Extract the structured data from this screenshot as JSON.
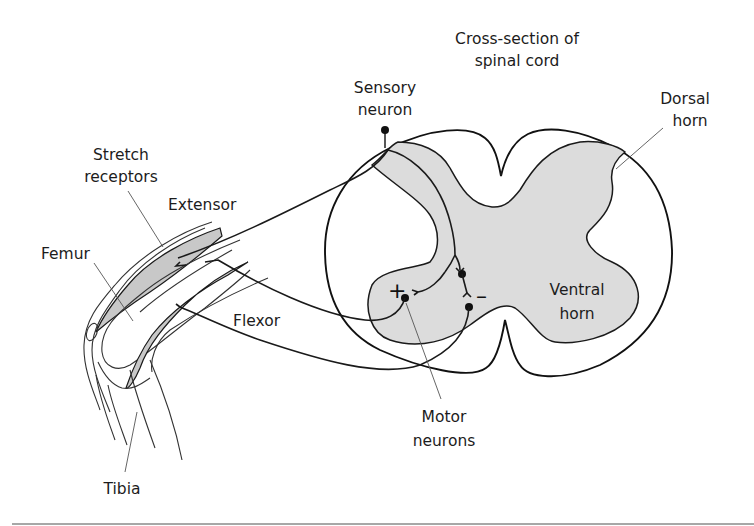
{
  "diagram": {
    "type": "anatomical-schematic",
    "colors": {
      "background": "#ffffff",
      "grey_matter": "#dcdcdc",
      "muscle": "#c8c8c8",
      "outline": "#1a1a1a",
      "footer_rule": "#8a8a8a"
    }
  },
  "labels": {
    "title_line1": "Cross-section of",
    "title_line2": "spinal cord",
    "sensory_line1": "Sensory",
    "sensory_line2": "neuron",
    "dorsal_line1": "Dorsal",
    "dorsal_line2": "horn",
    "stretch_line1": "Stretch",
    "stretch_line2": "receptors",
    "extensor": "Extensor",
    "femur": "Femur",
    "flexor": "Flexor",
    "ventral_line1": "Ventral",
    "ventral_line2": "horn",
    "motor_line1": "Motor",
    "motor_line2": "neurons",
    "tibia": "Tibia",
    "excitatory_sign": "+",
    "inhibitory_sign": "–"
  }
}
